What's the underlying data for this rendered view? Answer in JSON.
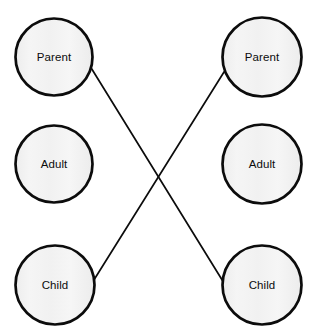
{
  "diagram": {
    "type": "transactional-analysis-ego-state-diagram",
    "background_color": "#ffffff",
    "node_fill_color": "#f2f2f2",
    "node_stroke_color": "#0c0c0c",
    "line_color": "#0c0c0c",
    "text_color": "#0c0c0c",
    "node_radius": 39,
    "node_stroke_width": 2.6,
    "line_stroke_width": 1.6,
    "left_person": {
      "name": "person-left",
      "center_x": 54,
      "nodes": [
        {
          "id": "left-parent",
          "label": "Parent",
          "cx": 54,
          "cy": 57,
          "r": 39
        },
        {
          "id": "left-adult",
          "label": "Adult",
          "cx": 54,
          "cy": 164,
          "r": 39
        },
        {
          "id": "left-child",
          "label": "Child",
          "cx": 55,
          "cy": 285,
          "r": 40
        }
      ]
    },
    "right_person": {
      "name": "person-right",
      "center_x": 262,
      "nodes": [
        {
          "id": "right-parent",
          "label": "Parent",
          "cx": 262,
          "cy": 57,
          "r": 40
        },
        {
          "id": "right-adult",
          "label": "Adult",
          "cx": 262,
          "cy": 164,
          "r": 40
        },
        {
          "id": "right-child",
          "label": "Child",
          "cx": 262,
          "cy": 285,
          "r": 40
        }
      ]
    },
    "transaction_lines": [
      {
        "id": "line-left-parent-to-right-child",
        "from": "left-parent",
        "to": "right-child",
        "x1": 85,
        "y1": 58,
        "x2": 224,
        "y2": 283
      },
      {
        "id": "line-left-child-to-right-parent",
        "from": "left-child",
        "to": "right-parent",
        "x1": 92,
        "y1": 283,
        "x2": 224,
        "y2": 72
      }
    ],
    "crossing_point": {
      "x": 157,
      "y": 168
    }
  }
}
